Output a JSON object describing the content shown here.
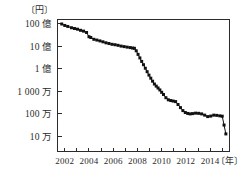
{
  "chart_data": {
    "type": "line",
    "title": "",
    "xlabel": "〔年〕",
    "ylabel": "〔円〕",
    "yscale": "log",
    "ylim": [
      50000,
      20000000000
    ],
    "xlim": [
      2001.4,
      2015.6
    ],
    "grid": false,
    "legend": null,
    "y_ticks": [
      {
        "value": 10000000000,
        "label": "100 億"
      },
      {
        "value": 1000000000,
        "label": "10 億"
      },
      {
        "value": 100000000,
        "label": "1 億"
      },
      {
        "value": 10000000,
        "label": "1 000 万"
      },
      {
        "value": 1000000,
        "label": "100 万"
      },
      {
        "value": 100000,
        "label": "10 万"
      }
    ],
    "x_ticks": [
      {
        "value": 2002,
        "label": "2002"
      },
      {
        "value": 2003,
        "label": ""
      },
      {
        "value": 2004,
        "label": "2004"
      },
      {
        "value": 2005,
        "label": ""
      },
      {
        "value": 2006,
        "label": "2006"
      },
      {
        "value": 2007,
        "label": ""
      },
      {
        "value": 2008,
        "label": "2008"
      },
      {
        "value": 2009,
        "label": ""
      },
      {
        "value": 2010,
        "label": "2010"
      },
      {
        "value": 2011,
        "label": ""
      },
      {
        "value": 2012,
        "label": "2012"
      },
      {
        "value": 2013,
        "label": ""
      },
      {
        "value": 2014,
        "label": "2014"
      },
      {
        "value": 2015,
        "label": ""
      }
    ],
    "series": [
      {
        "name": "cost",
        "marker": "square",
        "color": "#111111",
        "x": [
          2001.75,
          2002.0,
          2002.25,
          2002.55,
          2002.8,
          2003.05,
          2003.3,
          2003.55,
          2003.8,
          2004.0,
          2004.15,
          2004.4,
          2004.65,
          2004.9,
          2005.15,
          2005.4,
          2005.65,
          2005.9,
          2006.15,
          2006.4,
          2006.65,
          2006.9,
          2007.15,
          2007.4,
          2007.6,
          2007.75,
          2007.9,
          2008.05,
          2008.2,
          2008.35,
          2008.5,
          2008.65,
          2008.8,
          2008.95,
          2009.1,
          2009.25,
          2009.4,
          2009.55,
          2009.7,
          2009.85,
          2010.0,
          2010.15,
          2010.35,
          2010.55,
          2010.75,
          2010.95,
          2011.15,
          2011.35,
          2011.55,
          2011.75,
          2011.95,
          2012.15,
          2012.35,
          2012.55,
          2012.8,
          2013.05,
          2013.3,
          2013.55,
          2013.8,
          2014.05,
          2014.3,
          2014.55,
          2014.8,
          2015.0,
          2015.15,
          2015.3
        ],
        "y": [
          9500000000,
          8200000000,
          7400000000,
          6500000000,
          6000000000,
          5600000000,
          5000000000,
          4600000000,
          4000000000,
          2600000000,
          2400000000,
          2000000000,
          1850000000,
          1700000000,
          1550000000,
          1400000000,
          1300000000,
          1200000000,
          1150000000,
          1080000000,
          1000000000,
          950000000,
          900000000,
          860000000,
          820000000,
          800000000,
          620000000,
          430000000,
          300000000,
          210000000,
          150000000,
          105000000,
          74000000,
          52000000,
          38000000,
          28000000,
          21000000,
          17000000,
          14000000,
          11500000,
          9000000,
          7200000,
          5200000,
          4200000,
          3900000,
          3700000,
          3500000,
          2600000,
          1900000,
          1400000,
          1150000,
          1050000,
          1000000,
          1030000,
          1080000,
          1060000,
          1000000,
          880000,
          760000,
          800000,
          880000,
          860000,
          820000,
          790000,
          320000,
          130000
        ]
      }
    ]
  }
}
